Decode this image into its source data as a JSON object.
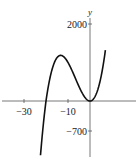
{
  "chart_data": {
    "type": "line",
    "title": "",
    "xlabel": "",
    "ylabel": "y",
    "function": "y = x^3 + 20x^2",
    "x_ticks": [
      {
        "value": -30,
        "label": "−30"
      },
      {
        "value": -10,
        "label": "−10"
      }
    ],
    "y_ticks": [
      {
        "value": 2000,
        "label": "2000"
      },
      {
        "value": -700,
        "label": "−700"
      }
    ],
    "xlim": [
      -40,
      22
    ],
    "ylim": [
      -1250,
      2500
    ],
    "grid": false,
    "legend": null,
    "series": [
      {
        "name": "f(x)",
        "x": [
          -22.5,
          -21,
          -20,
          -18,
          -16,
          -13.3,
          -10,
          -8,
          -6,
          -4,
          -2,
          0,
          2,
          4,
          6,
          7
        ],
        "y": [
          -1265.6,
          -441,
          0,
          648,
          1024,
          1185,
          1000,
          768,
          504,
          256,
          72,
          0,
          88,
          384,
          936,
          1323
        ]
      }
    ],
    "colors": {
      "curve": "#111111",
      "axis": "#555555"
    }
  }
}
